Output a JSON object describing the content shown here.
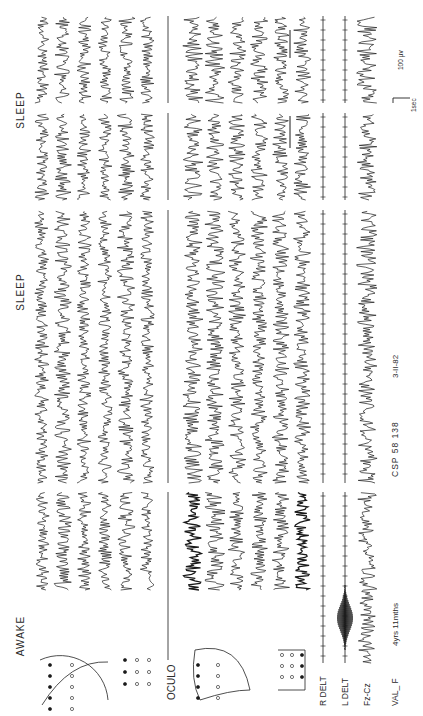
{
  "figure": {
    "orientation": "rotated-90-ccw",
    "ink_color": "#1a1a1a",
    "paper_color": "#ffffff"
  },
  "states": [
    {
      "label": "AWAKE"
    },
    {
      "label": "SLEEP"
    },
    {
      "label": "SLEEP"
    }
  ],
  "channel_groups": [
    {
      "name": "scalp-montage-1",
      "channels": 4,
      "icon": "electrode-head-diagram-icon"
    },
    {
      "name": "scalp-montage-2",
      "channels": 2,
      "icon": "electrode-grid-diagram-icon"
    },
    {
      "name": "oculo",
      "label": "OCULO"
    },
    {
      "name": "scalp-montage-3",
      "channels": 4,
      "icon": "electrode-head-diagram-icon"
    },
    {
      "name": "scalp-montage-4",
      "channels": 2,
      "icon": "electrode-grid-diagram-icon"
    }
  ],
  "channel_labels": {
    "oculo": "OCULO",
    "r_delt": "R DELT",
    "l_delt": "L DELT",
    "fz_cz": "Fz-Cz"
  },
  "footer": {
    "patient": "VAL_ F",
    "age": "4yrs 11mths",
    "record_id": "CSP 58 138",
    "date": "3-II-82"
  },
  "calibration": {
    "amplitude_label": "100 µv",
    "time_label": "1sec"
  },
  "segments": 4
}
